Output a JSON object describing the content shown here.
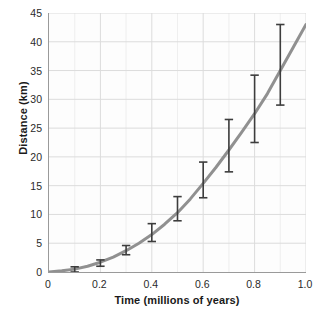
{
  "chart_data": {
    "type": "line",
    "title": "",
    "xlabel": "Time (millions of years)",
    "ylabel": "Distance (km)",
    "xlim": [
      0,
      1.0
    ],
    "ylim": [
      0,
      45
    ],
    "grid": true,
    "legend": null,
    "xticks": [
      "0",
      "0.2",
      "0.4",
      "0.6",
      "0.8",
      "1.0"
    ],
    "xtick_values": [
      0,
      0.2,
      0.4,
      0.6,
      0.8,
      1.0
    ],
    "yticks": [
      "0",
      "5",
      "10",
      "15",
      "20",
      "25",
      "30",
      "35",
      "40",
      "45"
    ],
    "ytick_values": [
      0,
      5,
      10,
      15,
      20,
      25,
      30,
      35,
      40,
      45
    ],
    "x_minor_step": 0.1,
    "series": [
      {
        "name": "model curve",
        "type": "line",
        "color": "#8a8a8a",
        "x": [
          0,
          0.05,
          0.1,
          0.15,
          0.2,
          0.25,
          0.3,
          0.35,
          0.4,
          0.45,
          0.5,
          0.55,
          0.6,
          0.65,
          0.7,
          0.75,
          0.8,
          0.85,
          0.9,
          0.95,
          1.0
        ],
        "y": [
          0,
          0.2,
          0.5,
          1.0,
          1.7,
          2.6,
          3.7,
          5.0,
          6.5,
          8.3,
          10.3,
          12.7,
          15.4,
          18.2,
          21.2,
          24.3,
          27.5,
          31.0,
          35.0,
          39.0,
          43.0
        ]
      },
      {
        "name": "measurements",
        "type": "errorbar",
        "color": "#3d3d3d",
        "x": [
          0.1,
          0.2,
          0.3,
          0.4,
          0.5,
          0.6,
          0.7,
          0.8,
          0.9
        ],
        "y": [
          0.4,
          1.6,
          3.8,
          6.2,
          10.2,
          15.4,
          21.2,
          27.5,
          35.0
        ],
        "y_low": [
          0.0,
          1.0,
          3.0,
          5.3,
          8.9,
          12.9,
          17.4,
          22.5,
          29.0
        ],
        "y_high": [
          0.9,
          2.1,
          4.6,
          8.4,
          13.1,
          19.1,
          26.5,
          34.2,
          43.0
        ]
      }
    ]
  },
  "colors": {
    "curve": "#8a8a8a",
    "errorbar": "#3d3d3d",
    "grid": "#dcdcdc",
    "axis": "#9a9a9a",
    "text": "#1a1a1a",
    "plot_background": "#fdfdfd",
    "page_background": "#ffffff"
  }
}
